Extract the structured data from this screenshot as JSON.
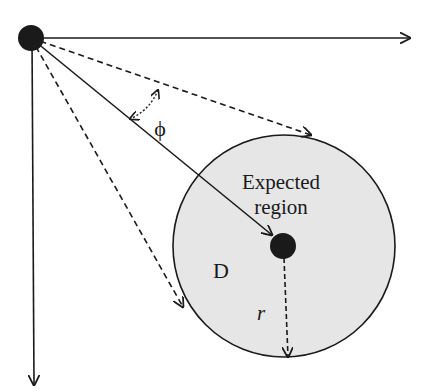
{
  "diagram": {
    "labels": {
      "angle": "ϕ",
      "region_line1": "Expected",
      "region_line2": "region",
      "region_name": "D",
      "radius": "r"
    },
    "colors": {
      "stroke": "#1a1a1a",
      "region_fill": "#e6e6e6",
      "background": "#ffffff"
    }
  }
}
